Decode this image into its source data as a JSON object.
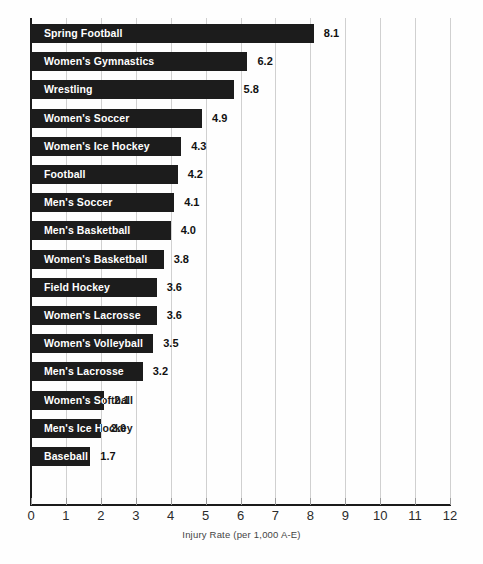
{
  "chart_data": {
    "type": "bar",
    "orientation": "horizontal",
    "title": "",
    "xlabel": "Injury Rate (per 1,000 A-E)",
    "ylabel": "",
    "xlim": [
      0,
      12
    ],
    "xticks": [
      0,
      1,
      2,
      3,
      4,
      5,
      6,
      7,
      8,
      9,
      10,
      11,
      12
    ],
    "xtick_labels": [
      "0",
      "1",
      "2",
      "3",
      "4",
      "5",
      "6",
      "7",
      "8",
      "9",
      "10",
      "11",
      "12"
    ],
    "grid": "vertical",
    "legend": "none",
    "bar_color": "#1c1c1c",
    "label_color": "#ffffff",
    "value_color": "#111111",
    "categories": [
      "Spring Football",
      "Women's Gymnastics",
      "Wrestling",
      "Women's Soccer",
      "Women's Ice Hockey",
      "Football",
      "Men's Soccer",
      "Men's Basketball",
      "Women's Basketball",
      "Field Hockey",
      "Women's Lacrosse",
      "Women's Volleyball",
      "Men's Lacrosse",
      "Women's Softball",
      "Men's Ice Hockey",
      "Baseball"
    ],
    "values": [
      8.1,
      6.2,
      5.8,
      4.9,
      4.3,
      4.2,
      4.1,
      4.0,
      3.8,
      3.6,
      3.6,
      3.5,
      3.2,
      2.1,
      2.0,
      1.7
    ],
    "value_labels": [
      "8.1",
      "6.2",
      "5.8",
      "4.9",
      "4.3",
      "4.2",
      "4.1",
      "4.0",
      "3.8",
      "3.6",
      "3.6",
      "3.5",
      "3.2",
      "2.1",
      "2.0",
      "1.7"
    ]
  }
}
